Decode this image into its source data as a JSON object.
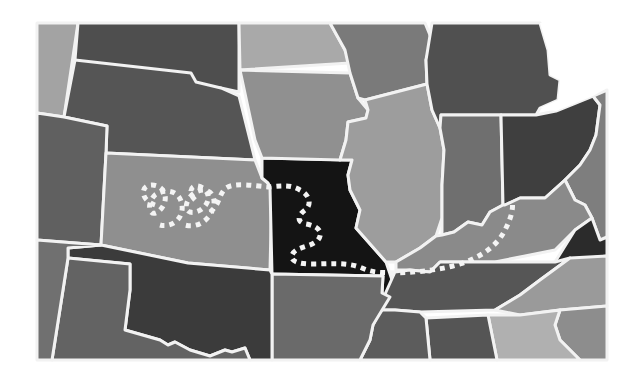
{
  "map": {
    "width": 639,
    "height": 385,
    "background": "#ffffff",
    "border_color": "#f2f2f2",
    "frame": {
      "x": 37,
      "y": 23,
      "w": 570,
      "h": 338
    },
    "states": [
      {
        "id": "montana-wyoming-west",
        "fill": "#a3a3a3",
        "points": "37,23 78,23 64,117 37,113"
      },
      {
        "id": "north-dakota",
        "fill": "#4e4e4e",
        "points": "78,23 239,23 239,92 221,88 191,86 75,60"
      },
      {
        "id": "south-dakota-nebraska",
        "fill": "#555555",
        "points": "75,60 191,73 196,82 221,88 239,96 255,160 106,153 107,126 64,117"
      },
      {
        "id": "colorado-west",
        "fill": "#606060",
        "points": "37,113 64,117 107,126 106,153 101,245 37,240"
      },
      {
        "id": "kansas",
        "fill": "#8f8f8f",
        "points": "106,153 255,160 262,178 268,183 272,187 270,270 188,263 101,245"
      },
      {
        "id": "missouri",
        "fill": "#141414",
        "points": "262,158 352,160 348,175 350,190 360,210 356,228 386,262 392,280 390,297 382,293 383,276 272,274 270,187 268,183 262,178"
      },
      {
        "id": "minnesota",
        "fill": "#a9a9a9",
        "points": "239,23 330,23 345,50 350,63 240,70"
      },
      {
        "id": "iowa",
        "fill": "#909090",
        "points": "240,70 350,73 358,98 368,110 366,118 348,122 346,140 340,160 262,158 255,140"
      },
      {
        "id": "wisconsin",
        "fill": "#7a7a7a",
        "points": "330,23 425,23 432,40 426,60 427,84 365,100 358,98 350,73 345,50"
      },
      {
        "id": "illinois",
        "fill": "#9d9d9d",
        "points": "365,100 427,84 432,110 440,128 444,150 442,185 442,218 436,236 420,248 396,262 386,262 356,228 360,210 350,190 348,175 352,160 340,160 346,140 348,122 366,118 368,110"
      },
      {
        "id": "michigan",
        "fill": "#505050",
        "points": "432,23 540,23 548,50 550,75 560,80 558,100 540,108 536,115 441,115 440,128 432,110 427,84 426,60"
      },
      {
        "id": "indiana",
        "fill": "#6f6f6f",
        "points": "441,115 501,115 503,205 490,212 482,225 468,222 454,232 442,235 442,185 444,150 440,128"
      },
      {
        "id": "ohio",
        "fill": "#3f3f3f",
        "points": "501,115 536,115 556,111 593,96 600,105 596,135 590,150 580,165 565,180 545,198 520,198 505,205 503,205"
      },
      {
        "id": "pa-wv-east",
        "fill": "#7e7e7e",
        "points": "593,96 607,90 607,245 600,240 592,218 585,205 575,200 565,180 580,165 590,150 596,135 600,105"
      },
      {
        "id": "kentucky",
        "fill": "#8a8a8a",
        "points": "396,262 420,248 436,236 442,235 454,232 468,222 482,225 490,212 503,205 505,205 520,198 545,198 565,180 575,200 585,205 592,218 575,230 555,250 495,262 440,262 430,272 410,270 396,270"
      },
      {
        "id": "virginia-tip",
        "fill": "#2b2b2b",
        "points": "575,230 592,218 600,240 607,237 607,256 555,262"
      },
      {
        "id": "tennessee",
        "fill": "#565656",
        "points": "395,272 410,270 430,272 440,262 495,262 555,262 570,258 540,280 520,295 495,310 420,312 395,310 380,310 386,292"
      },
      {
        "id": "virginia-carolina",
        "fill": "#9a9a9a",
        "points": "570,258 607,256 607,306 560,310 520,315 495,310 520,295 540,280"
      },
      {
        "id": "carolina-south",
        "fill": "#8d8d8d",
        "points": "560,310 607,306 607,360 580,360 560,340 555,325"
      },
      {
        "id": "georgia-alabama-east",
        "fill": "#b0b0b0",
        "points": "488,315 520,315 560,310 555,325 560,340 580,360 497,360"
      },
      {
        "id": "alabama-west",
        "fill": "#555555",
        "points": "426,318 488,315 497,360 430,360"
      },
      {
        "id": "mississippi",
        "fill": "#5c5c5c",
        "points": "380,310 395,310 420,312 426,318 430,360 360,360 370,340 373,325"
      },
      {
        "id": "arkansas",
        "fill": "#6a6a6a",
        "points": "272,274 383,276 382,293 390,297 373,325 370,340 360,360 272,360"
      },
      {
        "id": "oklahoma",
        "fill": "#3b3b3b",
        "points": "101,245 188,263 270,270 272,274 272,360 250,360 245,348 232,352 225,350 210,356 190,350 175,342 168,345 160,340 125,330 130,290 130,264 68,258 68,248"
      },
      {
        "id": "texas-panhandle",
        "fill": "#636363",
        "points": "68,258 130,264 130,290 125,330 160,340 168,345 175,342 190,350 210,356 225,350 232,352 245,348 250,360 52,360"
      },
      {
        "id": "new-mexico-west",
        "fill": "#707070",
        "points": "37,240 101,245 68,248 68,258 52,360 37,360"
      }
    ],
    "lake_michigan_cut": {
      "fill": "#ffffff",
      "points": "540,23 607,23 607,88 593,96 556,111 548,110 540,108 558,100 560,80 550,75 548,50"
    },
    "route": {
      "style": "dotted",
      "color": "#f4f4f4",
      "description": "dotted route: spiral in Kansas, east into Missouri, S-curve through Missouri, east along Kentucky-Tennessee line, then northeast through Kentucky",
      "path": "M 155 205 C 140 200 140 185 152 185 C 165 185 170 200 160 210 C 150 220 145 205 155 195 C 165 188 180 190 182 205 C 184 220 170 228 160 225 M 195 200 C 185 190 195 180 205 190 C 215 200 200 215 190 212 C 182 209 188 196 196 192 C 210 185 220 198 210 215 C 205 222 196 228 185 225 M 210 212 C 220 205 218 195 226 188 C 235 182 255 186 268 187 C 280 186 290 184 300 190 C 310 195 312 205 305 210 C 298 215 296 222 306 224 C 318 226 324 232 318 240 C 310 248 296 246 292 255 C 290 262 300 264 312 264 C 330 264 348 262 362 268 C 375 274 385 272 396 273 C 420 272 440 270 460 264 C 478 258 496 248 505 230 C 510 220 514 210 512 200"
    }
  }
}
